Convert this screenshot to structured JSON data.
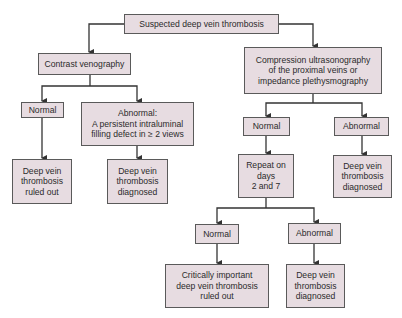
{
  "diagram": {
    "type": "flowchart",
    "colors": {
      "box_fill": "#e7dce1",
      "box_border": "#5a5a5a",
      "line": "#333333",
      "text": "#2b2b2b"
    },
    "nodes": {
      "root": "Suspected deep vein thrombosis",
      "venography": "Contrast venography",
      "ven_normal": "Normal",
      "ven_abnormal": "Abnormal:\nA persistent intraluminal\nfilling defect in ≥ 2 views",
      "ven_ruled_out": "Deep vein\nthrombosis\nruled out",
      "ven_diagnosed": "Deep vein\nthrombosis\ndiagnosed",
      "compression": "Compression ultrasonography\nof the proximal veins or\nimpedance plethysmography",
      "comp_normal": "Normal",
      "comp_abnormal": "Abnormal",
      "repeat": "Repeat on\ndays\n2 and 7",
      "comp_diagnosed": "Deep vein\nthrombosis\ndiagnosed",
      "rep_normal": "Normal",
      "rep_abnormal": "Abnormal",
      "rep_ruled_out": "Critically important\ndeep vein thrombosis\nruled out",
      "rep_diagnosed": "Deep vein\nthrombosis\ndiagnosed"
    },
    "edges": [
      [
        "root",
        "venography"
      ],
      [
        "root",
        "compression"
      ],
      [
        "venography",
        "ven_normal"
      ],
      [
        "venography",
        "ven_abnormal"
      ],
      [
        "ven_normal",
        "ven_ruled_out"
      ],
      [
        "ven_abnormal",
        "ven_diagnosed"
      ],
      [
        "compression",
        "comp_normal"
      ],
      [
        "compression",
        "comp_abnormal"
      ],
      [
        "comp_normal",
        "repeat"
      ],
      [
        "comp_abnormal",
        "comp_diagnosed"
      ],
      [
        "repeat",
        "rep_normal"
      ],
      [
        "repeat",
        "rep_abnormal"
      ],
      [
        "rep_normal",
        "rep_ruled_out"
      ],
      [
        "rep_abnormal",
        "rep_diagnosed"
      ]
    ]
  }
}
